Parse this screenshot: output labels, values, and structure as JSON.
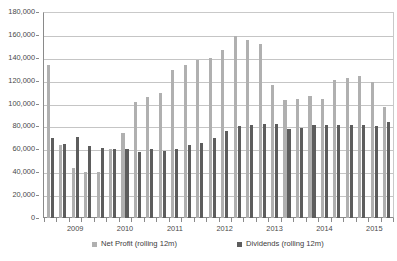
{
  "chart_data": {
    "type": "bar",
    "title": "",
    "subtitle": "",
    "xlabel": "",
    "ylabel": "",
    "ylim": [
      0,
      180000
    ],
    "ytick_step": 20000,
    "ytick_labels": [
      "0",
      "20,000",
      "40,000",
      "60,000",
      "80,000",
      "100,000",
      "120,000",
      "140,000",
      "160,000",
      "180,000"
    ],
    "ytick_values": [
      0,
      20000,
      40000,
      60000,
      80000,
      100000,
      120000,
      140000,
      160000,
      180000
    ],
    "grid": true,
    "grid_axis": "y",
    "legend_position": "bottom",
    "bar_mode": "grouped",
    "x_tick_labels_shown": [
      "2009",
      "2010",
      "2011",
      "2012",
      "2013",
      "2014",
      "2015"
    ],
    "x_label_period_index": [
      2,
      6,
      10,
      14,
      18,
      22,
      26
    ],
    "categories": [
      "2008 Q3",
      "2008 Q4",
      "2009 Q1",
      "2009 Q2",
      "2009 Q3",
      "2009 Q4",
      "2010 Q1",
      "2010 Q2",
      "2010 Q3",
      "2010 Q4",
      "2011 Q1",
      "2011 Q2",
      "2011 Q3",
      "2011 Q4",
      "2012 Q1",
      "2012 Q2",
      "2012 Q3",
      "2012 Q4",
      "2013 Q1",
      "2013 Q2",
      "2013 Q3",
      "2013 Q4",
      "2014 Q1",
      "2014 Q2",
      "2014 Q3",
      "2014 Q4",
      "2015 Q1",
      "2015 Q2"
    ],
    "series": [
      {
        "name": "Net Profit (rolling 12m)",
        "color": "#b0b0b0",
        "values": [
          134000,
          64000,
          44000,
          40000,
          40000,
          60000,
          74000,
          101000,
          106000,
          109000,
          129000,
          134000,
          138000,
          140000,
          147000,
          159000,
          156000,
          152000,
          116000,
          103000,
          104000,
          107000,
          104000,
          121000,
          122000,
          124000,
          119000,
          97000
        ]
      },
      {
        "name": "Dividends (rolling 12m)",
        "color": "#5d5d5d",
        "values": [
          70000,
          65000,
          71000,
          63000,
          61000,
          60000,
          60000,
          58000,
          60000,
          59000,
          60000,
          64000,
          66000,
          70000,
          76000,
          80000,
          81000,
          82000,
          82000,
          78000,
          79000,
          81000,
          81000,
          81000,
          81000,
          81000,
          80000,
          84000
        ]
      }
    ]
  },
  "legend": {
    "entries": [
      {
        "label": "Net Profit (rolling 12m)",
        "color": "#b0b0b0"
      },
      {
        "label": "Dividends (rolling 12m)",
        "color": "#5d5d5d"
      }
    ]
  },
  "colors": {
    "net_profit": "#b0b0b0",
    "dividends": "#5d5d5d",
    "gridline": "#c5c5c5",
    "axis": "#8a8a8a",
    "text": "#4a4a4a",
    "background": "#ffffff"
  }
}
